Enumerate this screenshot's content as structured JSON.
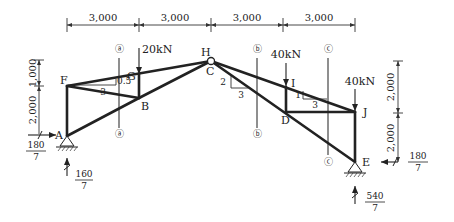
{
  "diagram": {
    "type": "truss_structure",
    "nodes": [
      {
        "id": "A",
        "label": "A"
      },
      {
        "id": "B",
        "label": "B"
      },
      {
        "id": "C",
        "label": "C",
        "also": "H",
        "hinge": true
      },
      {
        "id": "D",
        "label": "D"
      },
      {
        "id": "E",
        "label": "E"
      },
      {
        "id": "F",
        "label": "F"
      },
      {
        "id": "G",
        "label": "G"
      },
      {
        "id": "H",
        "label": "H"
      },
      {
        "id": "I",
        "label": "I"
      },
      {
        "id": "J",
        "label": "J"
      }
    ],
    "members": [
      [
        "A",
        "F"
      ],
      [
        "F",
        "C"
      ],
      [
        "F",
        "B"
      ],
      [
        "A",
        "B"
      ],
      [
        "B",
        "C"
      ],
      [
        "G",
        "B"
      ],
      [
        "C",
        "J"
      ],
      [
        "C",
        "E"
      ],
      [
        "I",
        "D"
      ],
      [
        "D",
        "J"
      ],
      [
        "J",
        "E"
      ]
    ],
    "dimensions": {
      "horizontal": [
        "3,000",
        "3,000",
        "3,000",
        "3,000"
      ],
      "left_vertical": [
        "1,000",
        "2,000"
      ],
      "right_vertical": [
        "2,000",
        "2,000"
      ]
    },
    "loads": [
      {
        "at": "G",
        "label": "20kN"
      },
      {
        "at": "I",
        "label": "40kN"
      },
      {
        "at": "J",
        "label": "40kN"
      }
    ],
    "slopes": [
      {
        "near": "F",
        "rise": "0.5",
        "run": "3"
      },
      {
        "near": "C",
        "rise": "2",
        "run": "3"
      },
      {
        "near": "I",
        "rise": "1",
        "run": "3"
      }
    ],
    "sections": [
      {
        "label": "ⓐ",
        "bottom": "ⓐ"
      },
      {
        "label": "ⓑ",
        "bottom": "ⓑ"
      },
      {
        "label": "ⓒ",
        "bottom": "ⓒ"
      }
    ],
    "reactions": {
      "A_horizontal": {
        "num": "180",
        "den": "7"
      },
      "A_vertical": {
        "num": "160",
        "den": "7"
      },
      "E_horizontal": {
        "num": "180",
        "den": "7"
      },
      "E_vertical": {
        "num": "540",
        "den": "7"
      }
    }
  }
}
